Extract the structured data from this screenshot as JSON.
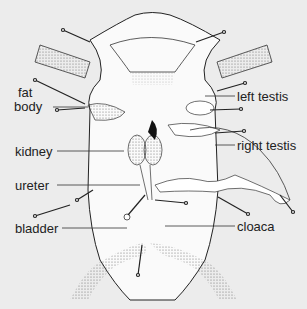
{
  "diagram": {
    "background_color": "#ececec",
    "line_color": "#222222",
    "labels": [
      {
        "id": "fat-body",
        "text_line1": "fat",
        "text_line2": "body",
        "side": "left"
      },
      {
        "id": "kidney",
        "text": "kidney",
        "side": "left"
      },
      {
        "id": "ureter",
        "text": "ureter",
        "side": "left"
      },
      {
        "id": "bladder",
        "text": "bladder",
        "side": "left"
      },
      {
        "id": "left-testis",
        "text": "left testis",
        "side": "right"
      },
      {
        "id": "right-testis",
        "text": "right testis",
        "side": "right"
      },
      {
        "id": "cloaca",
        "text": "cloaca",
        "side": "right"
      }
    ]
  }
}
